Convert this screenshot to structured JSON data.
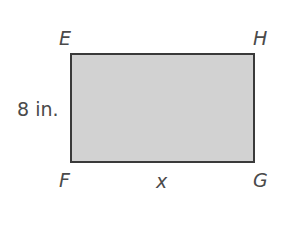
{
  "diagram": {
    "shape": "rectangle",
    "fill_color": "#d2d2d2",
    "stroke_color": "#3a3a3a",
    "vertices": {
      "top_left": "E",
      "top_right": "H",
      "bottom_left": "F",
      "bottom_right": "G"
    },
    "side_labels": {
      "left_side": "8 in.",
      "bottom_side": "x"
    }
  }
}
